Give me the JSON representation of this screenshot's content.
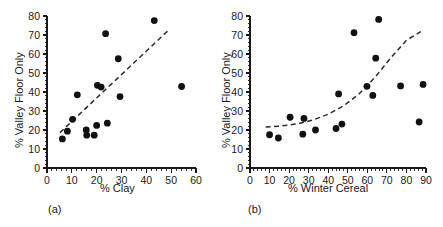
{
  "figure": {
    "panels": [
      {
        "id": "a",
        "caption": "(a)",
        "xlabel": "% Clay",
        "ylabel": "% Valley Floor Only"
      },
      {
        "id": "b",
        "caption": "(b)",
        "xlabel": "% Winter Cereal",
        "ylabel": "% Valley Floor Only"
      }
    ]
  },
  "chart_data": [
    {
      "type": "scatter",
      "panel": "a",
      "title": "",
      "xlabel": "% Clay",
      "ylabel": "% Valley Floor Only",
      "xlim": [
        0,
        60
      ],
      "ylim": [
        0,
        80
      ],
      "xticks": [
        0,
        10,
        20,
        30,
        40,
        50,
        60
      ],
      "yticks": [
        0,
        10,
        20,
        30,
        40,
        50,
        60,
        70,
        80
      ],
      "xticklabels": [
        "0",
        "10",
        "20",
        "30",
        "40",
        "50",
        "60"
      ],
      "yticklabels": [
        "0",
        "10",
        "20",
        "30",
        "40",
        "50",
        "60",
        "70",
        "80"
      ],
      "xminor_step": 2,
      "yminor_step": 2,
      "grid": false,
      "legend": false,
      "marker": "filled-circle",
      "marker_color": "#111111",
      "points": [
        {
          "x": 6.2,
          "y": 15.3
        },
        {
          "x": 8.2,
          "y": 19.4
        },
        {
          "x": 10.3,
          "y": 25.6
        },
        {
          "x": 12.2,
          "y": 38.5
        },
        {
          "x": 15.8,
          "y": 20.0
        },
        {
          "x": 16.0,
          "y": 17.3
        },
        {
          "x": 19.0,
          "y": 17.3
        },
        {
          "x": 20.0,
          "y": 22.4
        },
        {
          "x": 20.3,
          "y": 43.5
        },
        {
          "x": 21.8,
          "y": 42.6
        },
        {
          "x": 23.6,
          "y": 70.7
        },
        {
          "x": 24.3,
          "y": 23.6
        },
        {
          "x": 28.7,
          "y": 57.5
        },
        {
          "x": 29.4,
          "y": 37.6
        },
        {
          "x": 43.2,
          "y": 77.6
        },
        {
          "x": 54.2,
          "y": 42.9
        }
      ],
      "fit": {
        "style": "dashed",
        "kind": "linear",
        "x_start": 5.2,
        "y_start": 18.6,
        "x_end": 48.5,
        "y_end": 72.0
      }
    },
    {
      "type": "scatter",
      "panel": "b",
      "title": "",
      "xlabel": "% Winter Cereal",
      "ylabel": "% Valley Floor Only",
      "xlim": [
        0,
        90
      ],
      "ylim": [
        0,
        80
      ],
      "xticks": [
        0,
        10,
        20,
        30,
        40,
        50,
        60,
        70,
        80,
        90
      ],
      "yticks": [
        0,
        10,
        20,
        30,
        40,
        50,
        60,
        70,
        80
      ],
      "xticklabels": [
        "0",
        "10",
        "20",
        "30",
        "40",
        "50",
        "60",
        "70",
        "80",
        "90"
      ],
      "yticklabels": [
        "0",
        "10",
        "20",
        "30",
        "40",
        "50",
        "60",
        "70",
        "80"
      ],
      "xminor_step": 2,
      "yminor_step": 2,
      "grid": false,
      "legend": false,
      "marker": "filled-circle",
      "marker_color": "#111111",
      "points": [
        {
          "x": 10.0,
          "y": 17.5
        },
        {
          "x": 14.5,
          "y": 15.8
        },
        {
          "x": 20.5,
          "y": 26.7
        },
        {
          "x": 27.0,
          "y": 17.8
        },
        {
          "x": 27.6,
          "y": 26.1
        },
        {
          "x": 33.5,
          "y": 20.0
        },
        {
          "x": 44.0,
          "y": 20.8
        },
        {
          "x": 45.3,
          "y": 39.0
        },
        {
          "x": 47.0,
          "y": 23.1
        },
        {
          "x": 53.2,
          "y": 71.2
        },
        {
          "x": 59.8,
          "y": 43.0
        },
        {
          "x": 62.8,
          "y": 38.2
        },
        {
          "x": 64.3,
          "y": 57.8
        },
        {
          "x": 65.8,
          "y": 78.2
        },
        {
          "x": 77.0,
          "y": 43.2
        },
        {
          "x": 86.5,
          "y": 24.2
        },
        {
          "x": 88.5,
          "y": 44.0
        }
      ],
      "fit": {
        "style": "dashed",
        "kind": "exponential",
        "x_start": 8.0,
        "x_end": 88.0,
        "curve_points": [
          {
            "x": 8.0,
            "y": 21.6
          },
          {
            "x": 16.0,
            "y": 22.1
          },
          {
            "x": 24.0,
            "y": 23.2
          },
          {
            "x": 32.0,
            "y": 25.2
          },
          {
            "x": 40.0,
            "y": 28.3
          },
          {
            "x": 48.0,
            "y": 32.8
          },
          {
            "x": 56.0,
            "y": 39.2
          },
          {
            "x": 64.0,
            "y": 47.8
          },
          {
            "x": 72.0,
            "y": 58.0
          },
          {
            "x": 80.0,
            "y": 67.2
          },
          {
            "x": 88.0,
            "y": 72.2
          }
        ]
      }
    }
  ]
}
